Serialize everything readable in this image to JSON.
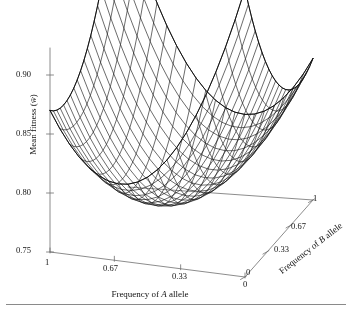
{
  "figure": {
    "kind": "3d-surface-wireframe",
    "background_color": "#ffffff",
    "line_color": "#111111",
    "axis_color": "#6f6f6f",
    "footer_rule_color": "#8a8a8a"
  },
  "axes": {
    "z": {
      "title_prefix": "Mean fitness (",
      "title_symbol": "w̄",
      "title_suffix": ")",
      "ticks": [
        "0.90",
        "0.85",
        "0.80",
        "0.75"
      ],
      "min": 0.75,
      "max": 0.92
    },
    "x": {
      "title_prefix": "Frequency of ",
      "title_symbol": "A",
      "title_suffix": " allele",
      "ticks": [
        "1",
        "0.67",
        "0.33",
        "0"
      ],
      "min": 0,
      "max": 1
    },
    "y": {
      "title_prefix": "Frequency of ",
      "title_symbol": "B",
      "title_suffix": " allele",
      "ticks": [
        "0",
        "0.33",
        "0.67",
        "1"
      ],
      "min": 0,
      "max": 1
    }
  },
  "chart_data": {
    "type": "surface",
    "title": "",
    "xlabel": "Frequency of A allele",
    "ylabel": "Frequency of B allele",
    "zlabel": "Mean fitness (w̄)",
    "xlim": [
      0,
      1
    ],
    "ylim": [
      0,
      1
    ],
    "zlim": [
      0.75,
      0.92
    ],
    "xticks": [
      1,
      0.67,
      0.33,
      0
    ],
    "yticks": [
      0,
      0.33,
      0.67,
      1
    ],
    "zticks": [
      0.75,
      0.8,
      0.85,
      0.9
    ],
    "grid": false,
    "legend": false,
    "nx": 21,
    "ny": 21,
    "surface_model": {
      "form": "w = base + ax*(2*x-1)^2 + ay*(2*y-1)^2 + axy*(2*x-1)*(2*y-1) + tilt_y*y",
      "base": 0.772,
      "ax": 0.108,
      "ay": 0.052,
      "axy": 0.062,
      "tilt_y": 0.0,
      "corner_values": {
        "x0_y0": 0.9,
        "x1_y0": 0.838,
        "x0_y1": 0.838,
        "x1_y1": 0.9
      },
      "saddle_center": {
        "x": 0.5,
        "y": 0.5,
        "z": 0.772
      }
    },
    "sampled_grid_z": [
      [
        0.9,
        0.882,
        0.866,
        0.852,
        0.84,
        0.83,
        0.823,
        0.817,
        0.814,
        0.813,
        0.814,
        0.817,
        0.823,
        0.83,
        0.84,
        0.852,
        0.866,
        0.882,
        0.9
      ],
      [
        0.874,
        0.857,
        0.842,
        0.829,
        0.818,
        0.809,
        0.802,
        0.798,
        0.795,
        0.795,
        0.797,
        0.801,
        0.807,
        0.816,
        0.826,
        0.839,
        0.854,
        0.871,
        0.89
      ],
      [
        0.852,
        0.836,
        0.822,
        0.81,
        0.8,
        0.792,
        0.786,
        0.782,
        0.78,
        0.781,
        0.783,
        0.788,
        0.795,
        0.804,
        0.815,
        0.829,
        0.845,
        0.863,
        0.883
      ],
      [
        0.834,
        0.819,
        0.806,
        0.795,
        0.786,
        0.779,
        0.774,
        0.771,
        0.77,
        0.771,
        0.774,
        0.779,
        0.787,
        0.796,
        0.808,
        0.822,
        0.839,
        0.858,
        0.879
      ],
      [
        0.82,
        0.806,
        0.794,
        0.784,
        0.776,
        0.77,
        0.766,
        0.764,
        0.763,
        0.765,
        0.769,
        0.775,
        0.782,
        0.792,
        0.805,
        0.819,
        0.836,
        0.856,
        0.878
      ],
      [
        0.81,
        0.797,
        0.786,
        0.777,
        0.77,
        0.765,
        0.761,
        0.76,
        0.76,
        0.763,
        0.767,
        0.774,
        0.782,
        0.792,
        0.805,
        0.82,
        0.838,
        0.858,
        0.881
      ],
      [
        0.804,
        0.792,
        0.782,
        0.774,
        0.768,
        0.763,
        0.761,
        0.76,
        0.761,
        0.765,
        0.77,
        0.777,
        0.786,
        0.797,
        0.81,
        0.826,
        0.844,
        0.865,
        0.888
      ],
      [
        0.802,
        0.791,
        0.782,
        0.775,
        0.769,
        0.766,
        0.764,
        0.765,
        0.767,
        0.771,
        0.777,
        0.785,
        0.794,
        0.806,
        0.82,
        0.836,
        0.855,
        0.876,
        0.9
      ],
      [
        0.803,
        0.793,
        0.785,
        0.779,
        0.775,
        0.772,
        0.771,
        0.773,
        0.776,
        0.781,
        0.788,
        0.796,
        0.807,
        0.819,
        0.834,
        0.851,
        0.87,
        0.892,
        0.916
      ],
      [
        0.808,
        0.799,
        0.792,
        0.787,
        0.784,
        0.783,
        0.783,
        0.785,
        0.789,
        0.795,
        0.803,
        0.812,
        0.824,
        0.837,
        0.852,
        0.87,
        0.889,
        0.911,
        0.936
      ]
    ]
  }
}
